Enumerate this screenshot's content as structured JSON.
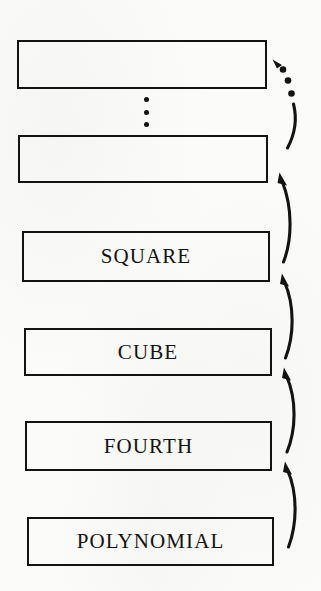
{
  "figure": {
    "kind": "hierarchy-chain-diagram",
    "background_color": "#fbfbf9",
    "ink_color": "#131313",
    "orientation": "vertical-stack-bottom-to-top",
    "vertical_ellipsis": {
      "name": "vertical-ellipsis",
      "dot_count": 3,
      "meaning": "omitted intermediate levels"
    }
  },
  "nodes": [
    {
      "id": "top-unlabeled",
      "label": "",
      "x": 17,
      "y": 40,
      "width": 250,
      "height": 49,
      "labeled": false
    },
    {
      "id": "second-unlabeled",
      "label": "",
      "x": 18,
      "y": 135,
      "width": 250,
      "height": 48,
      "labeled": false
    },
    {
      "id": "square",
      "label": "SQUARE",
      "x": 22,
      "y": 231,
      "width": 248,
      "height": 51,
      "labeled": true
    },
    {
      "id": "cube",
      "label": "CUBE",
      "x": 24,
      "y": 328,
      "width": 248,
      "height": 48,
      "labeled": true
    },
    {
      "id": "fourth",
      "label": "FOURTH",
      "x": 25,
      "y": 421,
      "width": 247,
      "height": 50,
      "labeled": true
    },
    {
      "id": "polynomial",
      "label": "POLYNOMIAL",
      "x": 27,
      "y": 517,
      "width": 247,
      "height": 49,
      "labeled": true
    }
  ],
  "connectors": [
    {
      "id": "polynomial-to-fourth",
      "from": "polynomial",
      "to": "fourth",
      "style": "solid-curved-arrow",
      "direction": "upward",
      "side": "right"
    },
    {
      "id": "fourth-to-cube",
      "from": "fourth",
      "to": "cube",
      "style": "solid-curved-arrow",
      "direction": "upward",
      "side": "right"
    },
    {
      "id": "cube-to-square",
      "from": "cube",
      "to": "square",
      "style": "solid-curved-arrow",
      "direction": "upward",
      "side": "right"
    },
    {
      "id": "square-to-second",
      "from": "square",
      "to": "second-unlabeled",
      "style": "solid-curved-arrow",
      "direction": "upward",
      "side": "right"
    },
    {
      "id": "second-to-top",
      "from": "second-unlabeled",
      "to": "top-unlabeled",
      "style": "dotted-curved-arrow",
      "direction": "upward",
      "side": "right",
      "dot_count": 3
    }
  ]
}
